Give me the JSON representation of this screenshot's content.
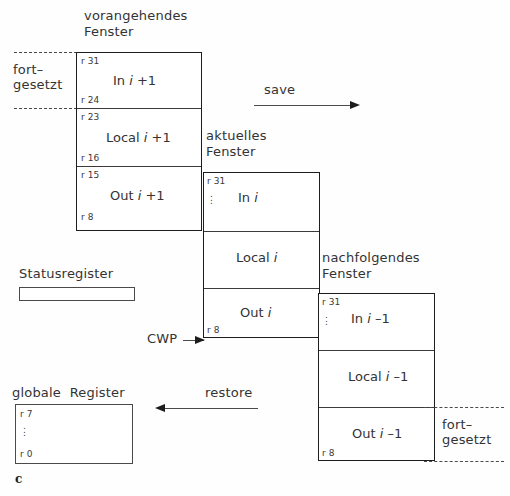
{
  "figure": {
    "label": "c",
    "title_note": "SPARC register window / overlapping windows diagram"
  },
  "continuation_left": {
    "line1": "fort–",
    "line2": "gesetzt"
  },
  "continuation_right": {
    "line1": "fort–",
    "line2": "gesetzt"
  },
  "windows": [
    {
      "id": "previous",
      "caption_line1": "vorangehendes",
      "caption_line2": "Fenster",
      "rows": [
        {
          "name": "In i +1",
          "reg_top": "r 31",
          "reg_bottom": "r 24",
          "dots": false
        },
        {
          "name": "Local i +1",
          "reg_top": "r 23",
          "reg_bottom": "r 16",
          "dots": false
        },
        {
          "name": "Out i +1",
          "reg_top": "r 15",
          "reg_bottom": "r 8",
          "dots": false
        }
      ]
    },
    {
      "id": "current",
      "caption_line1": "aktuelles",
      "caption_line2": "Fenster",
      "rows": [
        {
          "name": "In i",
          "reg_top": "r 31",
          "reg_bottom": "",
          "dots": true
        },
        {
          "name": "Local i",
          "reg_top": "",
          "reg_bottom": "",
          "dots": false
        },
        {
          "name": "Out i",
          "reg_top": "",
          "reg_bottom": "r 8",
          "dots": false
        }
      ]
    },
    {
      "id": "next",
      "caption_line1": "nachfolgendes",
      "caption_line2": "Fenster",
      "rows": [
        {
          "name": "In i –1",
          "reg_top": "r 31",
          "reg_bottom": "",
          "dots": true
        },
        {
          "name": "Local i –1",
          "reg_top": "",
          "reg_bottom": "",
          "dots": false
        },
        {
          "name": "Out i –1",
          "reg_top": "",
          "reg_bottom": "r 8",
          "dots": false
        }
      ]
    }
  ],
  "arrows": {
    "save": {
      "label": "save",
      "direction": "right"
    },
    "restore": {
      "label": "restore",
      "direction": "left"
    },
    "cwp": {
      "label": "CWP",
      "direction": "right"
    }
  },
  "status_register": {
    "label": "Statusregister"
  },
  "global_registers": {
    "label": "globale  Register",
    "reg_top": "r 7",
    "reg_bottom": "r 0"
  },
  "colors": {
    "ink": "#1d1d1d",
    "line": "#3a3a3a",
    "paper": "#fefefe"
  }
}
